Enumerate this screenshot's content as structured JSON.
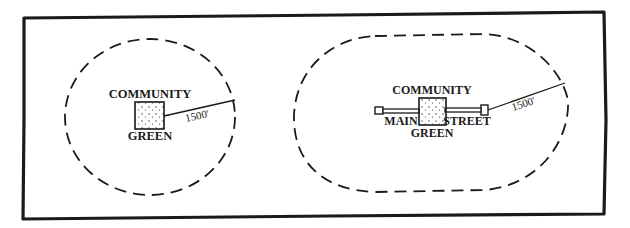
{
  "diagram": {
    "left_panel": {
      "top_label": "COMMUNITY",
      "bottom_label": "GREEN",
      "radius_label": "1500'"
    },
    "right_panel": {
      "top_label": "COMMUNITY",
      "bottom_label": "GREEN",
      "street_left_label": "MAIN",
      "street_right_label": "STREET",
      "radius_label": "1500'"
    },
    "colors": {
      "ink": "#1a1a1a",
      "background": "#ffffff"
    }
  }
}
